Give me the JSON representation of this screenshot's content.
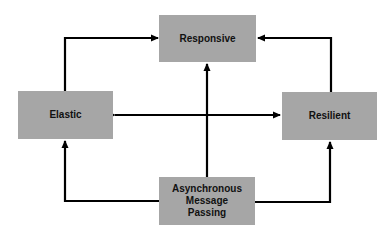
{
  "diagram": {
    "nodes": [
      {
        "id": "responsive",
        "label": "Responsive"
      },
      {
        "id": "elastic",
        "label": "Elastic"
      },
      {
        "id": "resilient",
        "label": "Resilient"
      },
      {
        "id": "message",
        "label": "Asynchronous\nMessage\nPassing"
      }
    ],
    "edges": [
      {
        "from": "elastic",
        "to": "responsive",
        "style": "elbow"
      },
      {
        "from": "resilient",
        "to": "responsive",
        "style": "elbow"
      },
      {
        "from": "message",
        "to": "responsive",
        "style": "straight"
      },
      {
        "from": "elastic",
        "to": "resilient",
        "style": "bidirectional"
      },
      {
        "from": "message",
        "to": "elastic",
        "style": "elbow"
      },
      {
        "from": "message",
        "to": "resilient",
        "style": "elbow"
      }
    ],
    "colors": {
      "box_fill": "#a6a6a6",
      "line": "#000000",
      "background": "#ffffff"
    }
  }
}
